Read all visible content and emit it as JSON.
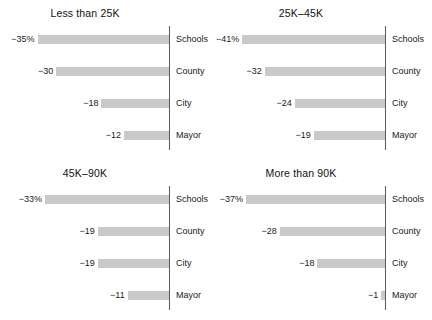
{
  "chart_data": {
    "type": "bar",
    "title": "",
    "orientation": "horizontal",
    "xlabel": "",
    "ylabel": "",
    "categories": [
      "Schools",
      "County",
      "City",
      "Mayor"
    ],
    "value_suffix_first_row": "%",
    "negative_sign": "−",
    "xlim": [
      -45,
      0
    ],
    "grid": false,
    "legend": null,
    "bar_color": "#c9c9c9",
    "axis_color": "#5b5b5b",
    "facets": [
      {
        "title": "Less than 25K",
        "values": [
          -35,
          -30,
          -18,
          -12
        ],
        "labels": [
          "−35%",
          "−30",
          "−18",
          "−12"
        ]
      },
      {
        "title": "25K–45K",
        "values": [
          -41,
          -32,
          -24,
          -19
        ],
        "labels": [
          "−41%",
          "−32",
          "−24",
          "−19"
        ]
      },
      {
        "title": "45K–90K",
        "values": [
          -33,
          -19,
          -19,
          -11
        ],
        "labels": [
          "−33%",
          "−19",
          "−19",
          "−11"
        ]
      },
      {
        "title": "More than 90K",
        "values": [
          -37,
          -28,
          -18,
          -1
        ],
        "labels": [
          "−37%",
          "−28",
          "−18",
          "−1"
        ]
      }
    ]
  },
  "caption": ""
}
